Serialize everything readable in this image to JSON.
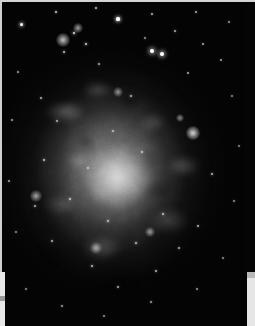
{
  "image": {
    "kind": "astronomical-photograph",
    "subject": "spiral galaxy",
    "color_mode": "grayscale",
    "description": "Grayscale photographic plate of a face-on spiral galaxy: a bright diffuse nucleus surrounded by mottled spiral arms studded with bright HII-region knots and star clusters, set against a black star field with scattered foreground stars.",
    "alt_text": "Grayscale image of a face-on spiral galaxy on a black sky"
  },
  "frame": {
    "border_color": "#d4d4d4",
    "page_color": "#c9c9c9",
    "strip_color": "#e8e8e8",
    "sky_color": "#020202"
  },
  "palette": {
    "sky_black": "#020202",
    "halo_gray": "#565656",
    "arm_gray": "#9a9a9a",
    "core_white": "#e2e2e2",
    "star_white": "#ffffff"
  },
  "galaxy": {
    "core": {
      "cx_pct": 46,
      "cy_pct": 54,
      "w_pct": 34,
      "h_pct": 24
    },
    "halo": {
      "cx_pct": 45,
      "cy_pct": 52,
      "w_pct": 96,
      "h_pct": 82
    }
  },
  "stars": [
    {
      "x": 56,
      "y": 12,
      "r": 0.9,
      "b": 0.7
    },
    {
      "x": 96,
      "y": 8,
      "r": 0.8,
      "b": 0.6
    },
    {
      "x": 118,
      "y": 19,
      "r": 1.6,
      "b": 1.0
    },
    {
      "x": 152,
      "y": 14,
      "r": 0.9,
      "b": 0.6
    },
    {
      "x": 21,
      "y": 24,
      "r": 1.5,
      "b": 0.95
    },
    {
      "x": 196,
      "y": 12,
      "r": 0.8,
      "b": 0.55
    },
    {
      "x": 229,
      "y": 22,
      "r": 0.8,
      "b": 0.5
    },
    {
      "x": 175,
      "y": 31,
      "r": 1.0,
      "b": 0.6
    },
    {
      "x": 145,
      "y": 38,
      "r": 0.9,
      "b": 0.55
    },
    {
      "x": 162,
      "y": 54,
      "r": 2.0,
      "b": 1.0
    },
    {
      "x": 203,
      "y": 44,
      "r": 0.9,
      "b": 0.55
    },
    {
      "x": 221,
      "y": 60,
      "r": 0.8,
      "b": 0.5
    },
    {
      "x": 188,
      "y": 73,
      "r": 0.9,
      "b": 0.55
    },
    {
      "x": 152,
      "y": 51,
      "r": 2.1,
      "b": 1.0
    },
    {
      "x": 232,
      "y": 96,
      "r": 0.9,
      "b": 0.5
    },
    {
      "x": 18,
      "y": 72,
      "r": 0.9,
      "b": 0.55
    },
    {
      "x": 12,
      "y": 120,
      "r": 0.8,
      "b": 0.5
    },
    {
      "x": 9,
      "y": 181,
      "r": 0.9,
      "b": 0.55
    },
    {
      "x": 16,
      "y": 232,
      "r": 0.9,
      "b": 0.5
    },
    {
      "x": 26,
      "y": 289,
      "r": 0.9,
      "b": 0.5
    },
    {
      "x": 62,
      "y": 306,
      "r": 1.0,
      "b": 0.55
    },
    {
      "x": 104,
      "y": 316,
      "r": 0.9,
      "b": 0.5
    },
    {
      "x": 151,
      "y": 302,
      "r": 1.0,
      "b": 0.55
    },
    {
      "x": 197,
      "y": 289,
      "r": 0.9,
      "b": 0.5
    },
    {
      "x": 223,
      "y": 258,
      "r": 0.9,
      "b": 0.5
    },
    {
      "x": 234,
      "y": 201,
      "r": 0.9,
      "b": 0.5
    },
    {
      "x": 239,
      "y": 146,
      "r": 0.8,
      "b": 0.45
    },
    {
      "x": 212,
      "y": 174,
      "r": 1.1,
      "b": 0.6
    },
    {
      "x": 86,
      "y": 44,
      "r": 1.2,
      "b": 0.75
    },
    {
      "x": 74,
      "y": 33,
      "r": 1.4,
      "b": 0.85
    },
    {
      "x": 64,
      "y": 52,
      "r": 1.1,
      "b": 0.7
    },
    {
      "x": 99,
      "y": 64,
      "r": 1.0,
      "b": 0.6
    },
    {
      "x": 131,
      "y": 96,
      "r": 1.1,
      "b": 0.65
    },
    {
      "x": 113,
      "y": 131,
      "r": 1.0,
      "b": 0.6
    },
    {
      "x": 142,
      "y": 152,
      "r": 1.0,
      "b": 0.6
    },
    {
      "x": 88,
      "y": 168,
      "r": 1.0,
      "b": 0.6
    },
    {
      "x": 70,
      "y": 199,
      "r": 1.2,
      "b": 0.7
    },
    {
      "x": 108,
      "y": 221,
      "r": 1.1,
      "b": 0.65
    },
    {
      "x": 136,
      "y": 243,
      "r": 1.1,
      "b": 0.65
    },
    {
      "x": 163,
      "y": 214,
      "r": 1.2,
      "b": 0.7
    },
    {
      "x": 179,
      "y": 248,
      "r": 1.0,
      "b": 0.6
    },
    {
      "x": 92,
      "y": 266,
      "r": 1.1,
      "b": 0.65
    },
    {
      "x": 52,
      "y": 241,
      "r": 1.0,
      "b": 0.6
    },
    {
      "x": 44,
      "y": 160,
      "r": 1.1,
      "b": 0.65
    },
    {
      "x": 35,
      "y": 206,
      "r": 1.0,
      "b": 0.6
    },
    {
      "x": 118,
      "y": 287,
      "r": 1.0,
      "b": 0.6
    },
    {
      "x": 156,
      "y": 271,
      "r": 1.0,
      "b": 0.6
    },
    {
      "x": 198,
      "y": 226,
      "r": 1.0,
      "b": 0.6
    },
    {
      "x": 57,
      "y": 121,
      "r": 1.0,
      "b": 0.6
    },
    {
      "x": 41,
      "y": 98,
      "r": 1.0,
      "b": 0.6
    }
  ],
  "knots": [
    {
      "x": 63,
      "y": 40,
      "r": 7,
      "b": 0.75,
      "label": "hii-region-northwest"
    },
    {
      "x": 78,
      "y": 28,
      "r": 5,
      "b": 0.6,
      "label": "hii-region-north"
    },
    {
      "x": 193,
      "y": 133,
      "r": 7,
      "b": 0.85,
      "label": "hii-region-east"
    },
    {
      "x": 180,
      "y": 118,
      "r": 4,
      "b": 0.5,
      "label": "hii-knot-ne"
    },
    {
      "x": 36,
      "y": 196,
      "r": 6,
      "b": 0.6,
      "label": "hii-region-west"
    },
    {
      "x": 96,
      "y": 248,
      "r": 6,
      "b": 0.55,
      "label": "hii-region-south"
    },
    {
      "x": 150,
      "y": 232,
      "r": 5,
      "b": 0.5,
      "label": "hii-knot-se"
    },
    {
      "x": 118,
      "y": 92,
      "r": 5,
      "b": 0.5,
      "label": "hii-knot-inner-north"
    }
  ]
}
